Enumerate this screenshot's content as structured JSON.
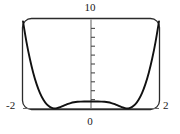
{
  "figure": {
    "title": "",
    "background_color": "#ffffff",
    "curve_color": "#111111",
    "frame_color": "#2b2b2b",
    "axis_color": "#555555"
  },
  "labels": {
    "y_max": "10",
    "x_min": "-2",
    "x_max": "2",
    "x_zero": "0"
  },
  "chart_data": {
    "type": "line",
    "title": "",
    "xlabel": "",
    "ylabel": "",
    "xlim": [
      -2,
      2
    ],
    "ylim": [
      0,
      10
    ],
    "grid": false,
    "legend": null,
    "frame": "rounded-rectangle",
    "x_axis": {
      "position_y": 0,
      "tick_labels": [
        "-2",
        "0",
        "2"
      ],
      "tick_values": [
        -2,
        0,
        2
      ]
    },
    "y_axis": {
      "position_x": 0,
      "top_label": "10",
      "tick_count": 9,
      "tick_values": [
        1,
        2,
        3,
        4,
        5,
        6,
        7,
        8,
        9
      ],
      "ticks_side": "right"
    },
    "series": [
      {
        "name": "double-well quartic",
        "description": "W-shaped quartic with two minima touching y=0 and a central local maximum",
        "x": [
          -2.0,
          -1.9,
          -1.8,
          -1.7,
          -1.6,
          -1.5,
          -1.4,
          -1.3,
          -1.2,
          -1.1,
          -1.0,
          -0.9,
          -0.8,
          -0.7,
          -0.6,
          -0.5,
          -0.4,
          -0.3,
          -0.2,
          -0.1,
          0.0,
          0.1,
          0.2,
          0.3,
          0.4,
          0.5,
          0.6,
          0.7,
          0.8,
          0.9,
          1.0,
          1.1,
          1.2,
          1.3,
          1.4,
          1.5,
          1.6,
          1.7,
          1.8,
          1.9,
          2.0
        ],
        "y": [
          9.73,
          7.48,
          5.58,
          4.0,
          2.72,
          1.71,
          0.97,
          0.45,
          0.15,
          0.02,
          0.04,
          0.16,
          0.32,
          0.48,
          0.61,
          0.7,
          0.75,
          0.77,
          0.78,
          0.78,
          0.78,
          0.78,
          0.78,
          0.77,
          0.75,
          0.7,
          0.61,
          0.48,
          0.32,
          0.16,
          0.04,
          0.02,
          0.15,
          0.45,
          0.97,
          1.71,
          2.72,
          4.0,
          5.58,
          7.48,
          9.73
        ],
        "minima": [
          {
            "x": -1.15,
            "y": 0.0
          },
          {
            "x": 1.15,
            "y": 0.0
          }
        ],
        "local_maximum": {
          "x": 0.0,
          "y": 0.78
        }
      }
    ]
  }
}
